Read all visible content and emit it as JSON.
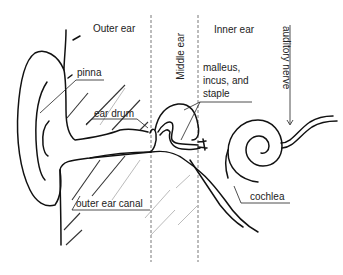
{
  "diagram": {
    "type": "anatomy",
    "regions": [
      {
        "id": "outer",
        "label": "Outer ear"
      },
      {
        "id": "middle",
        "label": "Middle ear"
      },
      {
        "id": "inner",
        "label": "Inner ear"
      }
    ],
    "labels": {
      "pinna": "pinna",
      "ear_drum": "ear drum",
      "ossicles_line1": "malleus,",
      "ossicles_line2": "incus, and",
      "ossicles_line3": "staple",
      "auditory_nerve": "auditory nerve",
      "cochlea": "cochlea",
      "outer_ear_canal": "outer ear canal"
    },
    "colors": {
      "ink": "#111111",
      "text": "#222222",
      "background": "#ffffff"
    }
  }
}
